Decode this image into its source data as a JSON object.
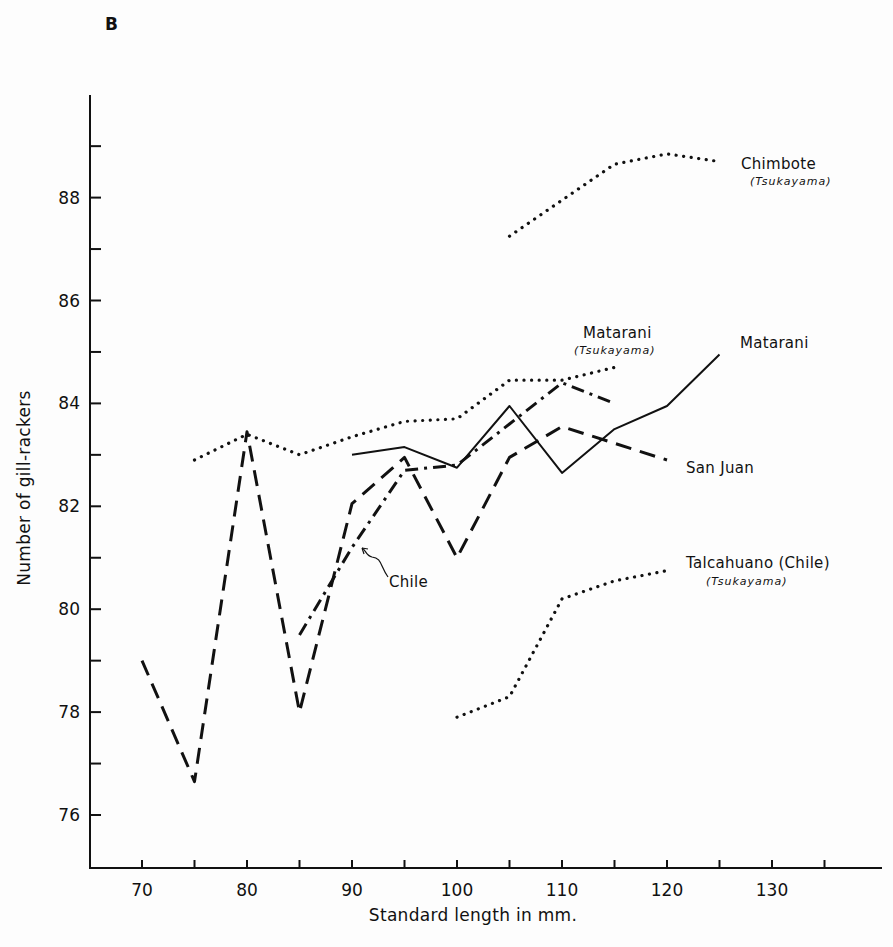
{
  "figure": {
    "panel_letter": "B"
  },
  "chart_data": {
    "type": "line",
    "title": "",
    "panel": "B",
    "xlabel": "Standard length in mm.",
    "ylabel": "Number of gill-rackers",
    "xlim": [
      65,
      140
    ],
    "ylim": [
      75,
      90
    ],
    "x_ticks": [
      70,
      75,
      80,
      85,
      90,
      95,
      100,
      105,
      110,
      115,
      120,
      125,
      130,
      135
    ],
    "x_tick_labels": [
      "70",
      "80",
      "90",
      "100",
      "110",
      "120",
      "130"
    ],
    "y_ticks": [
      76,
      77,
      78,
      79,
      80,
      81,
      82,
      83,
      84,
      85,
      86,
      87,
      88,
      89
    ],
    "y_tick_labels": [
      "76",
      "78",
      "80",
      "82",
      "84",
      "86",
      "88"
    ],
    "grid": false,
    "legend": "inline labels at line ends",
    "series": [
      {
        "name": "Matarani",
        "style": "solid",
        "x": [
          90,
          95,
          100,
          105,
          110,
          115,
          120,
          125
        ],
        "values": [
          83.0,
          83.15,
          82.75,
          83.95,
          82.65,
          83.5,
          83.95,
          84.95
        ]
      },
      {
        "name": "San Juan",
        "style": "dashed",
        "x": [
          70,
          75,
          80,
          85,
          90,
          95,
          100,
          105,
          110,
          120
        ],
        "values": [
          79.0,
          76.65,
          83.45,
          78.0,
          82.05,
          82.95,
          81.0,
          82.95,
          83.55,
          82.9
        ]
      },
      {
        "name": "Chile",
        "style": "dash-dot",
        "x": [
          85,
          90,
          95,
          100,
          105,
          110,
          115
        ],
        "values": [
          79.5,
          81.2,
          82.7,
          82.8,
          83.6,
          84.4,
          84.0
        ]
      },
      {
        "name": "Matarani (Tsukayama)",
        "style": "dotted",
        "x": [
          75,
          80,
          85,
          90,
          95,
          100,
          105,
          110,
          115
        ],
        "values": [
          82.9,
          83.4,
          83.0,
          83.35,
          83.65,
          83.7,
          84.45,
          84.45,
          84.7
        ]
      },
      {
        "name": "Chimbote (Tsukayama)",
        "style": "dotted",
        "x": [
          105,
          110,
          115,
          120,
          125
        ],
        "values": [
          87.25,
          87.95,
          88.65,
          88.85,
          88.7
        ]
      },
      {
        "name": "Talcahuano (Chile) (Tsukayama)",
        "style": "dotted",
        "x": [
          100,
          105,
          110,
          115,
          120
        ],
        "values": [
          77.9,
          78.3,
          80.2,
          80.55,
          80.75
        ]
      }
    ]
  },
  "labels": {
    "chimbote": "Chimbote",
    "chimbote_sub": "(Tsukayama)",
    "matarani_tsukayama": "Matarani",
    "matarani_tsukayama_sub": "(Tsukayama)",
    "matarani": "Matarani",
    "san_juan": "San Juan",
    "chile": "Chile",
    "talcahuano": "Talcahuano (Chile)",
    "talcahuano_sub": "(Tsukayama)"
  }
}
